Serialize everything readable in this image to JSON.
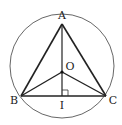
{
  "figure": {
    "circle": {
      "cx": 62,
      "cy": 66,
      "r": 52,
      "stroke": "#555555"
    },
    "points": {
      "A": {
        "x": 62,
        "y": 24,
        "label": "A",
        "lx": 62,
        "ly": 18
      },
      "B": {
        "x": 21,
        "y": 96,
        "label": "B",
        "lx": 14,
        "ly": 103
      },
      "C": {
        "x": 106,
        "y": 96,
        "label": "C",
        "lx": 112,
        "ly": 103
      },
      "O": {
        "x": 62,
        "y": 72,
        "label": "O",
        "lx": 70,
        "ly": 69
      },
      "I": {
        "x": 62,
        "y": 96,
        "label": "I",
        "lx": 62,
        "ly": 108
      }
    },
    "segments": [
      [
        "A",
        "B"
      ],
      [
        "A",
        "C"
      ],
      [
        "B",
        "C"
      ],
      [
        "A",
        "I"
      ],
      [
        "O",
        "B"
      ],
      [
        "O",
        "C"
      ]
    ],
    "right_angle_at": "I",
    "line_color": "#222222"
  },
  "labels": {
    "A": "A",
    "B": "B",
    "C": "C",
    "O": "O",
    "I": "I"
  }
}
